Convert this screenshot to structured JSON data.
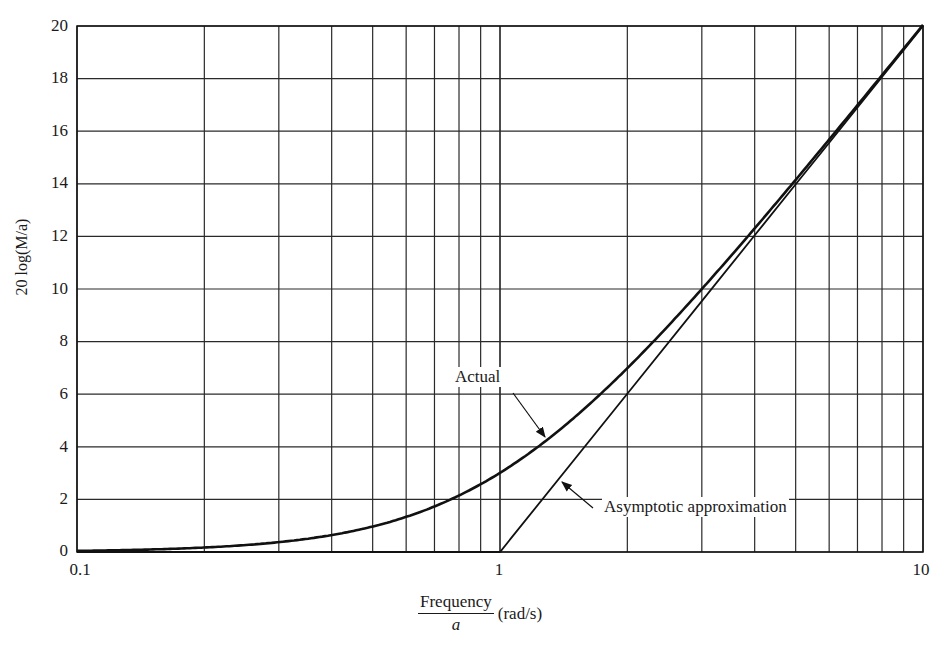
{
  "chart_data": {
    "type": "line",
    "title": "",
    "xlabel": "Frequency / a (rad/s)",
    "xlabel_numerator": "Frequency",
    "xlabel_denominator": "a",
    "xlabel_unit": "(rad/s)",
    "ylabel": "20 log(M/a)",
    "xscale": "log",
    "xlim": [
      0.1,
      10
    ],
    "ylim": [
      0,
      20
    ],
    "grid": true,
    "x_ticks": [
      "0.1",
      "1",
      "10"
    ],
    "y_ticks": [
      "0",
      "2",
      "4",
      "6",
      "8",
      "10",
      "12",
      "14",
      "16",
      "18",
      "20"
    ],
    "x": [
      0.1,
      0.2,
      0.3,
      0.4,
      0.5,
      0.6,
      0.7,
      0.8,
      0.9,
      1,
      2,
      3,
      4,
      5,
      6,
      7,
      8,
      9,
      10
    ],
    "series": [
      {
        "name": "Actual",
        "values": [
          0.04,
          0.17,
          0.37,
          0.64,
          0.97,
          1.34,
          1.73,
          2.15,
          2.58,
          3.01,
          6.99,
          10.0,
          12.3,
          14.15,
          15.68,
          16.99,
          18.13,
          19.14,
          20.04
        ]
      },
      {
        "name": "Asymptotic approximation",
        "values": [
          0,
          0,
          0,
          0,
          0,
          0,
          0,
          0,
          0,
          0,
          6.02,
          9.54,
          12.04,
          13.98,
          15.56,
          16.9,
          18.06,
          19.08,
          20
        ]
      }
    ],
    "annotations": [
      {
        "text": "Actual",
        "points_to": "Actual curve near x=1.3"
      },
      {
        "text": "Asymptotic approximation",
        "points_to": "Asymptote near x=1.4"
      }
    ],
    "legend": "none (inline annotations with arrows)"
  },
  "labels": {
    "y_axis": "20 log(M/a)",
    "x_num": "Frequency",
    "x_den": "a",
    "x_unit": "(rad/s)",
    "actual": "Actual",
    "asymptotic": "Asymptotic approximation",
    "yt": [
      "0",
      "2",
      "4",
      "6",
      "8",
      "10",
      "12",
      "14",
      "16",
      "18",
      "20"
    ],
    "xt": [
      "0.1",
      "1",
      "10"
    ]
  },
  "colors": {
    "line": "#111111",
    "grid": "#2a2a2a",
    "background": "#ffffff"
  }
}
